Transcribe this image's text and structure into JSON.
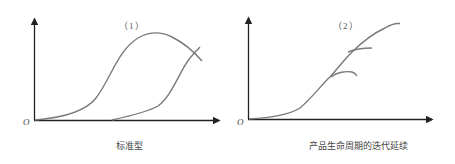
{
  "colors": {
    "axis": "#222222",
    "curve": "#7a7a7a",
    "text": "#444444"
  },
  "panels": [
    {
      "number_label": "（1）",
      "origin_label": "O",
      "caption": "标准型",
      "description": "Standard product life cycle: an original S-curve rises, peaks and declines while a second, later S-curve rises and crosses it."
    },
    {
      "number_label": "（2）",
      "origin_label": "O",
      "caption": "产品生命周期的迭代延续",
      "description": "Iterative continuation of the product life cycle: a single rising curve with successive branches that level off as newer iterations keep climbing higher."
    }
  ]
}
